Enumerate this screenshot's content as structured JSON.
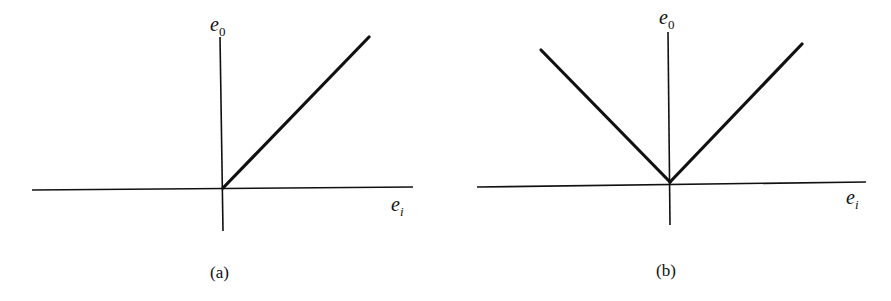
{
  "figure": {
    "panels": [
      {
        "id": "a",
        "caption": "(a)",
        "y_axis_label": {
          "base": "e",
          "subscript": "0"
        },
        "x_axis_label": {
          "base": "e",
          "subscript": "i"
        },
        "description": "Half-wave characteristic: e0 = 0 for ei < 0, e0 rises linearly for ei > 0"
      },
      {
        "id": "b",
        "caption": "(b)",
        "y_axis_label": {
          "base": "e",
          "subscript": "0"
        },
        "x_axis_label": {
          "base": "e",
          "subscript": "i"
        },
        "description": "Full-wave characteristic: e0 = |ei| (V-shaped)"
      }
    ]
  }
}
